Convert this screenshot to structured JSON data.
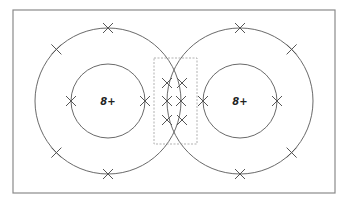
{
  "diagram": {
    "width": 351,
    "height": 206,
    "frame": {
      "x": 13,
      "y": 10,
      "w": 322,
      "h": 183,
      "color": "#8a8a8a"
    },
    "zone": {
      "x": 154,
      "y": 58,
      "w": 43,
      "h": 86,
      "color": "#a8a8a8"
    },
    "ring_color": "#6a6a6a",
    "mark_color": "#555555",
    "groups": [
      {
        "id": "left",
        "label": "8+",
        "center": {
          "x": 108,
          "y": 101
        },
        "outer_radius": 73,
        "inner_radius": 37,
        "outer_marks_deg": [
          90,
          135,
          225,
          270,
          0
        ],
        "inner_marks_deg": [
          180,
          0
        ]
      },
      {
        "id": "right",
        "label": "8+",
        "center": {
          "x": 240,
          "y": 101
        },
        "outer_radius": 73,
        "inner_radius": 37,
        "outer_marks_deg": [
          90,
          45,
          315,
          270,
          180
        ],
        "inner_marks_deg": [
          180,
          0
        ]
      }
    ],
    "crossing_marks": [
      {
        "x": 167,
        "y": 83
      },
      {
        "x": 182,
        "y": 83
      },
      {
        "x": 167,
        "y": 120
      },
      {
        "x": 182,
        "y": 120
      }
    ],
    "mark_size": 5
  }
}
